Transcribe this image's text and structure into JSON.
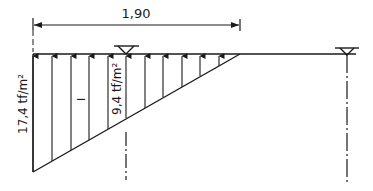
{
  "diagram": {
    "type": "load-diagram",
    "dimension": {
      "label": "1,90"
    },
    "loads": {
      "max_label": "17,4 tf/m²",
      "mid_label": "9,4 tf/m²",
      "region_marker": "I"
    },
    "supports": [
      {
        "name": "left-support",
        "symbol": "triangle"
      },
      {
        "name": "right-support",
        "symbol": "triangle"
      }
    ],
    "colors": {
      "line": "#1a1a1a",
      "background": "#ffffff"
    }
  }
}
